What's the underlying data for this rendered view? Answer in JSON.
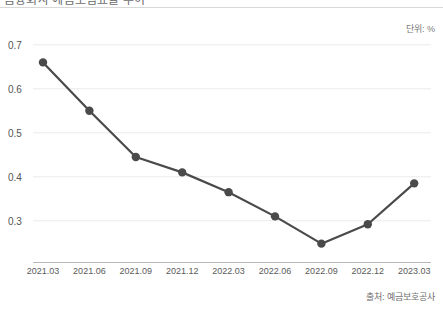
{
  "header": {
    "title_clipped": "금융회사 예금보험료율 추이",
    "unit_note": "단위: %"
  },
  "footer": {
    "source_note": "출처: 예금보호공사"
  },
  "chart_data": {
    "type": "line",
    "title": "",
    "xlabel": "",
    "ylabel": "",
    "unit": "%",
    "categories": [
      "2021.03",
      "2021.06",
      "2021.09",
      "2021.12",
      "2022.03",
      "2022.06",
      "2022.09",
      "2022.12",
      "2023.03"
    ],
    "values": [
      0.66,
      0.55,
      0.445,
      0.41,
      0.365,
      0.31,
      0.248,
      0.292,
      0.385
    ],
    "ylim": [
      0.204,
      0.72
    ],
    "yticks": [
      0.3,
      0.4,
      0.5,
      0.6,
      0.7
    ],
    "ytick_labels": [
      "0.3",
      "0.4",
      "0.5",
      "0.6",
      "0.7"
    ],
    "grid": true,
    "legend": "none",
    "series": [
      {
        "name": "예금보험료율",
        "color": "#4a4a4a",
        "marker": "circle",
        "values": [
          0.66,
          0.55,
          0.445,
          0.41,
          0.365,
          0.31,
          0.248,
          0.292,
          0.385
        ]
      }
    ]
  },
  "colors": {
    "line": "#4a4a4a",
    "marker": "#4a4a4a",
    "gridline": "#ebebeb",
    "axis": "#b8b8b8",
    "tick_text": "#555555"
  }
}
